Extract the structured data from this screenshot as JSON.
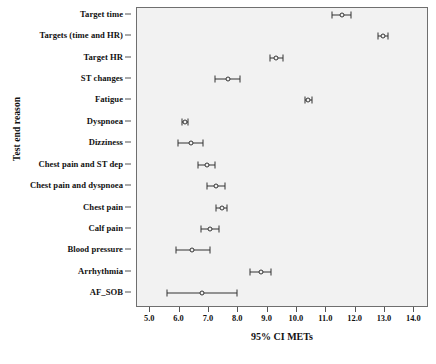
{
  "chart_data": {
    "type": "scatter",
    "title": "",
    "xlabel": "95% CI METs",
    "ylabel": "Test end reason",
    "xlim": [
      4.55,
      14.5
    ],
    "xticks": [
      "5.0",
      "6.0",
      "7.0",
      "8.0",
      "9.0",
      "10.0",
      "11.0",
      "12.0",
      "13.0",
      "14.0"
    ],
    "xtick_values": [
      5.0,
      6.0,
      7.0,
      8.0,
      9.0,
      10.0,
      11.0,
      12.0,
      13.0,
      14.0
    ],
    "grid": false,
    "legend": "none",
    "categories": [
      "Target time",
      "Targets (time and HR)",
      "Target HR",
      "ST changes",
      "Fatigue",
      "Dyspnoea",
      "Dizziness",
      "Chest pain and ST dep",
      "Chest pain and dyspnoea",
      "Chest pain",
      "Calf pain",
      "Blood pressure",
      "Arrhythmia",
      "AF_SOB"
    ],
    "series": [
      {
        "name": "95% CI METs",
        "points": [
          {
            "category": "Target time",
            "mean": 11.55,
            "lower": 11.2,
            "upper": 11.85
          },
          {
            "category": "Targets (time and HR)",
            "mean": 12.92,
            "lower": 12.75,
            "upper": 13.1
          },
          {
            "category": "Target HR",
            "mean": 9.3,
            "lower": 9.08,
            "upper": 9.52
          },
          {
            "category": "ST changes",
            "mean": 7.65,
            "lower": 7.22,
            "upper": 8.05
          },
          {
            "category": "Fatigue",
            "mean": 10.38,
            "lower": 10.28,
            "upper": 10.5
          },
          {
            "category": "Dyspnoea",
            "mean": 6.18,
            "lower": 6.08,
            "upper": 6.3
          },
          {
            "category": "Dizziness",
            "mean": 6.38,
            "lower": 5.95,
            "upper": 6.79
          },
          {
            "category": "Chest pain and ST dep",
            "mean": 6.92,
            "lower": 6.62,
            "upper": 7.22
          },
          {
            "category": "Chest pain and dyspnoea",
            "mean": 7.25,
            "lower": 6.95,
            "upper": 7.55
          },
          {
            "category": "Chest pain",
            "mean": 7.43,
            "lower": 7.25,
            "upper": 7.62
          },
          {
            "category": "Calf pain",
            "mean": 7.05,
            "lower": 6.72,
            "upper": 7.35
          },
          {
            "category": "Blood pressure",
            "mean": 6.42,
            "lower": 5.87,
            "upper": 7.03
          },
          {
            "category": "Arrhythmia",
            "mean": 8.78,
            "lower": 8.39,
            "upper": 9.1
          },
          {
            "category": "AF_SOB",
            "mean": 6.75,
            "lower": 5.57,
            "upper": 7.95
          }
        ]
      }
    ],
    "colors": {
      "panel_background": "#f2f2f2",
      "page_background": "#ffffff",
      "marker": "#333333",
      "axis": "#555555",
      "text": "#111111"
    }
  }
}
